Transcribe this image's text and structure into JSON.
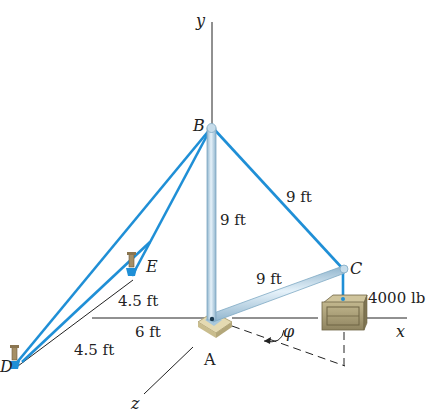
{
  "axes": {
    "x_label": "x",
    "y_label": "y",
    "z_label": "z"
  },
  "points": {
    "A": "A",
    "B": "B",
    "C": "C",
    "D": "D",
    "E": "E"
  },
  "dimensions": {
    "AB": "9 ft",
    "BC": "9 ft",
    "AC": "9 ft",
    "E_offset": "4.5 ft",
    "D_offset": "4.5 ft",
    "x_offset": "6 ft"
  },
  "load": "4000 lb",
  "angle_label": "φ",
  "colors": {
    "cable": "#1f8fd6",
    "boom": "#b9d6e8",
    "boom_edge": "#7fa9c4",
    "crate": "#a89a70",
    "crate_dark": "#6e6445",
    "base": "#ddd3a8",
    "anchor": "#1f8fd6",
    "axis": "#222222"
  }
}
